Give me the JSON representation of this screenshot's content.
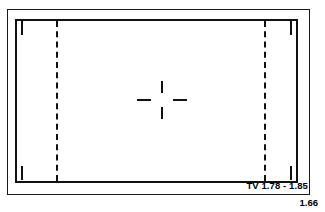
{
  "chart_data": {
    "type": "diagram",
    "ground_glass_format": "1.66",
    "frames": [
      {
        "name": "tv-safe-frame",
        "label": "TV 1.78 - 1.85",
        "style": "solid",
        "aspect_ratio_range": [
          1.78,
          1.85
        ]
      },
      {
        "name": "extraction-frame",
        "label": "1.66",
        "style": "dashed",
        "aspect_ratio": 1.66
      }
    ],
    "markings": [
      "outer-border",
      "inner-solid-rectangle",
      "four-corner-ticks",
      "two-vertical-dashed-lines",
      "center-crosshair"
    ]
  },
  "chart": {
    "tv_label": "TV 1.78 - 1.85",
    "ratio_label": "1.66",
    "line_color": "#111111",
    "background_color": "#ffffff"
  }
}
